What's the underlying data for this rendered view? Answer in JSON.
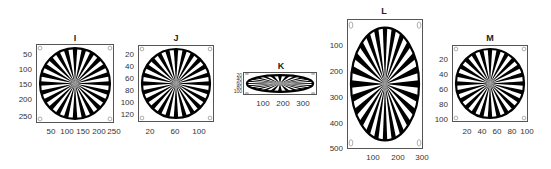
{
  "chart_data": [
    {
      "type": "image",
      "title": "I",
      "description": "Siemens star test pattern, circular",
      "xticks": [
        "50",
        "100",
        "150",
        "200",
        "250"
      ],
      "yticks": [
        "50",
        "100",
        "150",
        "200",
        "250"
      ],
      "xlim": [
        0,
        260
      ],
      "ylim": [
        0,
        260
      ],
      "spokes": 24
    },
    {
      "type": "image",
      "title": "J",
      "description": "Siemens star test pattern, circular",
      "xticks": [
        "20",
        "60",
        "100"
      ],
      "yticks": [
        "20",
        "40",
        "60",
        "80",
        "100",
        "120"
      ],
      "xlim": [
        0,
        125
      ],
      "ylim": [
        0,
        125
      ],
      "spokes": 24
    },
    {
      "type": "image",
      "title": "K",
      "description": "Siemens star test pattern, horizontally stretched ellipse",
      "xticks": [
        "100",
        "200",
        "300"
      ],
      "yticks": [
        "20",
        "40",
        "60",
        "80",
        "100"
      ],
      "xlim": [
        0,
        370
      ],
      "ylim": [
        0,
        110
      ],
      "spokes": 24
    },
    {
      "type": "image",
      "title": "L",
      "description": "Siemens star test pattern, vertically stretched ellipse",
      "xticks": [
        "100",
        "200",
        "300"
      ],
      "yticks": [
        "100",
        "200",
        "300",
        "400",
        "500"
      ],
      "xlim": [
        0,
        300
      ],
      "ylim": [
        0,
        500
      ],
      "spokes": 24
    },
    {
      "type": "image",
      "title": "M",
      "description": "Siemens star test pattern, circular",
      "xticks": [
        "20",
        "40",
        "60",
        "80",
        "100"
      ],
      "yticks": [
        "20",
        "40",
        "60",
        "80",
        "100"
      ],
      "xlim": [
        0,
        100
      ],
      "ylim": [
        0,
        100
      ],
      "spokes": 24
    }
  ],
  "colors": {
    "spoke": "#000000",
    "background": "#ffffff",
    "axis": "#555555",
    "marker": "#999999"
  }
}
